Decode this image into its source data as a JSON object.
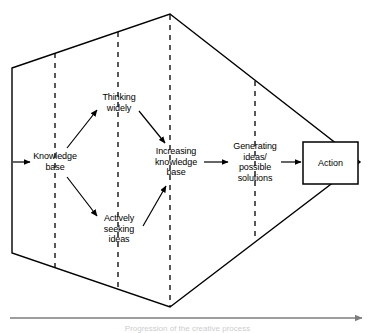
{
  "diagram": {
    "type": "process-flow",
    "background_color": "#ffffff",
    "stroke_color": "#000000",
    "axis_color": "#7d7d7d",
    "nodes": [
      {
        "id": "knowledge-base",
        "label": "Knowledge\nbase",
        "lines": [
          "Knowledge",
          "base"
        ],
        "x": 55,
        "y": 162
      },
      {
        "id": "thinking-widely",
        "label": "Thinking\nwidely",
        "lines": [
          "Thinking",
          "widely"
        ],
        "x": 119,
        "y": 103
      },
      {
        "id": "actively-seeking-ideas",
        "label": "Actively\nseeking\nideas",
        "lines": [
          "Actively",
          "seeking",
          "ideas"
        ],
        "x": 119,
        "y": 229
      },
      {
        "id": "increasing-knowledge-base",
        "label": "Increasing\nknowledge\nbase",
        "lines": [
          "Increasing",
          "knowledge",
          "base"
        ],
        "x": 176,
        "y": 162
      },
      {
        "id": "generating-ideas",
        "label": "Generating\nideas/\npossible\nsolutions",
        "lines": [
          "Generating",
          "ideas/",
          "possible",
          "solutions"
        ],
        "x": 255,
        "y": 162
      }
    ],
    "action_box": {
      "id": "action",
      "label": "Action",
      "x": 303,
      "y": 142,
      "width": 55,
      "height": 42
    },
    "hexagon": {
      "points": "12,68 170,14 360,162 170,307 12,253",
      "description": "Expanding then converging envelope"
    },
    "dashed_dividers": [
      {
        "id": "divider-1",
        "x": 55
      },
      {
        "id": "divider-2",
        "x": 118
      },
      {
        "id": "divider-3",
        "x": 170
      },
      {
        "id": "divider-4",
        "x": 255
      }
    ],
    "bottom_axis": {
      "id": "time-axis",
      "caption": "Progression of the creative process",
      "y": 318,
      "x_start": 10,
      "x_end": 362
    }
  }
}
